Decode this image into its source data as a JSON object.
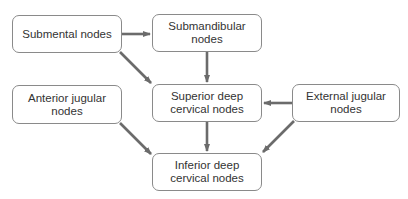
{
  "diagram": {
    "type": "flowchart",
    "nodes": {
      "submental": {
        "label": "Submental nodes"
      },
      "submandibular": {
        "label": "Submandibular nodes"
      },
      "anterior_jugular": {
        "label": "Anterior jugular nodes"
      },
      "superior_deep": {
        "label": "Superior deep cervical nodes"
      },
      "external_jugular": {
        "label": "External jugular nodes"
      },
      "inferior_deep": {
        "label": "Inferior deep cervical nodes"
      }
    },
    "edges": [
      {
        "from": "Submental nodes",
        "to": "Submandibular nodes"
      },
      {
        "from": "Submental nodes",
        "to": "Superior deep cervical nodes"
      },
      {
        "from": "Submandibular nodes",
        "to": "Superior deep cervical nodes"
      },
      {
        "from": "External jugular nodes",
        "to": "Superior deep cervical nodes"
      },
      {
        "from": "Anterior jugular nodes",
        "to": "Inferior deep cervical nodes"
      },
      {
        "from": "Superior deep cervical nodes",
        "to": "Inferior deep cervical nodes"
      },
      {
        "from": "External jugular nodes",
        "to": "Inferior deep cervical nodes"
      }
    ],
    "colors": {
      "border": "#8a8a8a",
      "arrow": "#6b6b6b",
      "text": "#333333"
    }
  }
}
